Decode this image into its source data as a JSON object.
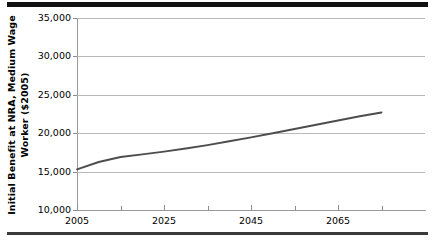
{
  "figure": {
    "ytitle_line1": "Initial Benefit at NRA, Medium Wage",
    "ytitle_line2": "Worker ($2005)",
    "line_color": "#4d4d4d",
    "grid_color": "#b9b9b9",
    "axis_color": "#9a9a9a",
    "rule_color": "#111111"
  },
  "chart_data": {
    "type": "line",
    "title": "",
    "xlabel": "",
    "ylabel": "Initial Benefit at NRA, Medium Wage Worker ($2005)",
    "xlim": [
      2005,
      2085
    ],
    "ylim": [
      10000,
      35000
    ],
    "grid": true,
    "legend": "none",
    "y_ticks": [
      10000,
      15000,
      20000,
      25000,
      30000,
      35000
    ],
    "y_ticklabels": [
      "10,000",
      "15,000",
      "20,000",
      "25,000",
      "30,000",
      "35,000"
    ],
    "x_ticks": [
      2005,
      2025,
      2045,
      2065
    ],
    "x_ticklabels": [
      "2005",
      "2025",
      "2045",
      "2065"
    ],
    "x_minor_ticks": [
      2015,
      2035,
      2055,
      2075
    ],
    "series": [
      {
        "name": "Initial Benefit at NRA, Medium Wage Worker",
        "x": [
          2005,
          2010,
          2015,
          2020,
          2025,
          2030,
          2035,
          2040,
          2045,
          2050,
          2055,
          2060,
          2065,
          2070,
          2075
        ],
        "values": [
          15300,
          16250,
          16900,
          17250,
          17600,
          18000,
          18450,
          18950,
          19450,
          20000,
          20550,
          21100,
          21650,
          22200,
          22700
        ]
      }
    ]
  }
}
